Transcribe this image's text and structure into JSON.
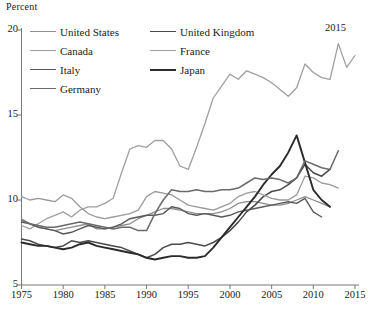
{
  "chart_data": {
    "type": "line",
    "title": "",
    "ylabel": "Percent",
    "xlabel": "",
    "ylim": [
      5,
      20
    ],
    "xlim": [
      1975,
      2015
    ],
    "yticks": [
      5,
      10,
      15,
      20
    ],
    "xticks": [
      1975,
      1980,
      1985,
      1990,
      1995,
      2000,
      2005,
      2010,
      2015
    ],
    "grid": false,
    "legend_position": "top-left",
    "annotations": [
      {
        "text": "2015",
        "x": 2013,
        "y": 19.5
      }
    ],
    "series": [
      {
        "name": "United States",
        "color": "#8e8e8e",
        "width": 1.3,
        "x": [
          1975,
          1976,
          1977,
          1978,
          1979,
          1980,
          1981,
          1982,
          1983,
          1984,
          1985,
          1986,
          1987,
          1988,
          1989,
          1990,
          1991,
          1992,
          1993,
          1994,
          1995,
          1996,
          1997,
          1998,
          1999,
          2000,
          2001,
          2002,
          2003,
          2004,
          2005,
          2006,
          2007,
          2008,
          2009,
          2010,
          2011,
          2012
        ],
        "values": [
          8.9,
          8.6,
          8.4,
          8.3,
          8.2,
          8.3,
          8.4,
          8.5,
          8.6,
          8.3,
          8.3,
          8.4,
          8.5,
          8.6,
          8.9,
          9.1,
          9.3,
          9.5,
          9.5,
          9.4,
          9.3,
          9.2,
          9.2,
          9.2,
          9.3,
          9.5,
          9.8,
          9.9,
          9.9,
          9.8,
          9.7,
          9.7,
          9.8,
          10.0,
          10.2,
          10.0,
          9.8,
          9.6
        ]
      },
      {
        "name": "United Kingdom",
        "color": "#4a4a4a",
        "width": 1.5,
        "x": [
          1975,
          1976,
          1977,
          1978,
          1979,
          1980,
          1981,
          1982,
          1983,
          1984,
          1985,
          1986,
          1987,
          1988,
          1989,
          1990,
          1991,
          1992,
          1993,
          1994,
          1995,
          1996,
          1997,
          1998,
          1999,
          2000,
          2001,
          2002,
          2003,
          2004,
          2005,
          2006,
          2007,
          2008,
          2009,
          2010,
          2011,
          2012
        ],
        "values": [
          7.7,
          7.6,
          7.4,
          7.3,
          7.2,
          7.3,
          7.6,
          7.5,
          7.6,
          7.5,
          7.4,
          7.3,
          7.2,
          7.0,
          6.8,
          6.6,
          6.8,
          7.2,
          7.4,
          7.4,
          7.5,
          7.4,
          7.3,
          7.5,
          7.8,
          8.2,
          8.7,
          9.3,
          9.7,
          10.2,
          10.5,
          10.6,
          10.9,
          11.3,
          12.1,
          11.6,
          11.4,
          11.8
        ]
      },
      {
        "name": "Canada",
        "color": "#9b9b9b",
        "width": 1.3,
        "x": [
          1975,
          1976,
          1977,
          1978,
          1979,
          1980,
          1981,
          1982,
          1983,
          1984,
          1985,
          1986,
          1987,
          1988,
          1989,
          1990,
          1991,
          1992,
          1993,
          1994,
          1995,
          1996,
          1997,
          1998,
          1999,
          2000,
          2001,
          2002,
          2003,
          2004,
          2005,
          2006,
          2007,
          2008,
          2009,
          2010,
          2011,
          2012,
          2013
        ],
        "values": [
          10.2,
          10.0,
          10.1,
          10.0,
          9.9,
          10.3,
          10.1,
          9.6,
          9.2,
          9.0,
          8.9,
          9.0,
          9.1,
          9.2,
          9.4,
          10.2,
          10.5,
          10.4,
          10.3,
          10.0,
          9.7,
          9.6,
          9.5,
          9.4,
          9.6,
          9.8,
          10.2,
          10.4,
          10.5,
          10.3,
          10.1,
          10.0,
          10.0,
          10.3,
          11.4,
          11.3,
          11.0,
          10.9,
          10.7
        ]
      },
      {
        "name": "France",
        "color": "#9f9f9f",
        "width": 1.3,
        "x": [
          1975,
          1976,
          1977,
          1978,
          1979,
          1980,
          1981,
          1982,
          1983,
          1984,
          1985,
          1986,
          1987,
          1988,
          1989,
          1990,
          1991,
          1992,
          1993,
          1994,
          1995,
          1996,
          1997,
          1998,
          1999,
          2000,
          2001,
          2002,
          2003,
          2004,
          2005,
          2006,
          2007,
          2008,
          2009,
          2010,
          2011,
          2012,
          2013,
          2014,
          2015
        ],
        "values": [
          8.5,
          8.3,
          8.6,
          8.9,
          9.1,
          9.3,
          9.0,
          9.4,
          9.6,
          9.6,
          9.8,
          10.1,
          11.6,
          13.0,
          13.2,
          13.1,
          13.5,
          13.5,
          13.0,
          12.0,
          11.8,
          13.1,
          14.5,
          16.0,
          16.7,
          17.4,
          17.1,
          17.6,
          17.4,
          17.2,
          16.9,
          16.5,
          16.1,
          16.6,
          18.0,
          17.5,
          17.2,
          17.1,
          19.2,
          17.8,
          18.5
        ]
      },
      {
        "name": "Italy",
        "color": "#5a5a5a",
        "width": 1.4,
        "x": [
          1975,
          1976,
          1977,
          1978,
          1979,
          1980,
          1981,
          1982,
          1983,
          1984,
          1985,
          1986,
          1987,
          1988,
          1989,
          1990,
          1991,
          1992,
          1993,
          1994,
          1995,
          1996,
          1997,
          1998,
          1999,
          2000,
          2001,
          2002,
          2003,
          2004,
          2005,
          2006,
          2007,
          2008,
          2009,
          2010,
          2011
        ],
        "values": [
          8.7,
          8.6,
          8.4,
          8.3,
          8.2,
          8.0,
          8.1,
          8.3,
          8.5,
          8.4,
          8.3,
          8.4,
          8.6,
          8.9,
          9.0,
          9.1,
          9.1,
          9.2,
          9.6,
          9.5,
          9.2,
          9.1,
          9.2,
          9.1,
          9.0,
          9.1,
          9.3,
          9.4,
          9.5,
          9.6,
          9.7,
          9.8,
          9.9,
          9.8,
          10.1,
          9.3,
          9.0
        ]
      },
      {
        "name": "Japan",
        "color": "#2b2b2b",
        "width": 1.9,
        "x": [
          1975,
          1976,
          1977,
          1978,
          1979,
          1980,
          1981,
          1982,
          1983,
          1984,
          1985,
          1986,
          1987,
          1988,
          1989,
          1990,
          1991,
          1992,
          1993,
          1994,
          1995,
          1996,
          1997,
          1998,
          1999,
          2000,
          2001,
          2002,
          2003,
          2004,
          2005,
          2006,
          2007,
          2008,
          2009,
          2010,
          2011,
          2012
        ],
        "values": [
          7.5,
          7.4,
          7.3,
          7.3,
          7.2,
          7.1,
          7.2,
          7.4,
          7.5,
          7.3,
          7.2,
          7.1,
          7.0,
          6.9,
          6.8,
          6.6,
          6.5,
          6.6,
          6.7,
          6.7,
          6.6,
          6.6,
          6.7,
          7.2,
          7.8,
          8.4,
          9.0,
          9.6,
          10.2,
          10.9,
          11.5,
          12.0,
          12.8,
          13.8,
          12.2,
          10.6,
          10.0,
          9.6
        ]
      },
      {
        "name": "Germany",
        "color": "#6a6a6a",
        "width": 1.5,
        "x": [
          1975,
          1976,
          1977,
          1978,
          1979,
          1980,
          1981,
          1982,
          1983,
          1984,
          1985,
          1986,
          1987,
          1988,
          1989,
          1990,
          1991,
          1992,
          1993,
          1994,
          1995,
          1996,
          1997,
          1998,
          1999,
          2000,
          2001,
          2002,
          2003,
          2004,
          2005,
          2006,
          2007,
          2008,
          2009,
          2010,
          2011,
          2012,
          2013
        ],
        "values": [
          8.8,
          8.6,
          8.5,
          8.4,
          8.4,
          8.5,
          8.6,
          8.7,
          8.6,
          8.5,
          8.4,
          8.3,
          8.4,
          8.4,
          8.2,
          8.2,
          9.2,
          10.0,
          10.6,
          10.5,
          10.5,
          10.6,
          10.5,
          10.5,
          10.6,
          10.6,
          10.7,
          11.0,
          11.3,
          11.2,
          11.3,
          11.2,
          11.0,
          11.3,
          12.3,
          12.1,
          11.9,
          11.8,
          12.9
        ]
      }
    ]
  },
  "legend": {
    "items": [
      {
        "label": "United States",
        "color": "#8e8e8e"
      },
      {
        "label": "United Kingdom",
        "color": "#4a4a4a"
      },
      {
        "label": "Canada",
        "color": "#9b9b9b"
      },
      {
        "label": "France",
        "color": "#9f9f9f"
      },
      {
        "label": "Italy",
        "color": "#5a5a5a"
      },
      {
        "label": "Japan",
        "color": "#2b2b2b"
      },
      {
        "label": "Germany",
        "color": "#6a6a6a"
      }
    ]
  },
  "axes": {
    "y_title": "Percent",
    "y_tick_labels": [
      "20",
      "15",
      "10",
      "5"
    ],
    "x_tick_labels": [
      "1975",
      "1980",
      "1985",
      "1990",
      "1995",
      "2000",
      "2005",
      "2010",
      "2015"
    ]
  },
  "end_label": "2015"
}
